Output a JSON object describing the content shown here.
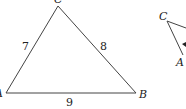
{
  "triangle1": {
    "vertices": {
      "A": "A",
      "B": "B",
      "C": "C"
    },
    "sides": {
      "AC": "7",
      "CB": "8",
      "AB": "9"
    }
  },
  "triangle2": {
    "vertices": {
      "C": "C",
      "A": "A"
    }
  },
  "colors": {
    "stroke": "#444444",
    "text": "#222222"
  }
}
